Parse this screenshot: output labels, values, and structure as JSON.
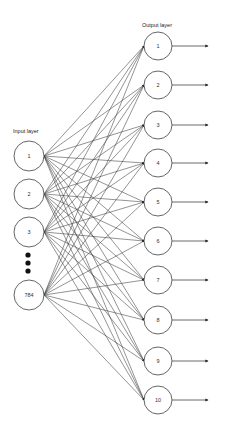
{
  "diagram": {
    "input_layer": {
      "label": "Input layer",
      "nodes": [
        {
          "label": "1",
          "cx": 29,
          "cy": 156
        },
        {
          "label": "2",
          "cx": 29,
          "cy": 194
        },
        {
          "label": "3",
          "cx": 29,
          "cy": 232
        },
        {
          "label": "784",
          "cx": 29,
          "cy": 295
        }
      ],
      "ellipsis_dots": [
        255,
        263,
        271
      ]
    },
    "output_layer": {
      "label": "Output layer",
      "nodes": [
        {
          "label": "1",
          "cx": 158,
          "cy": 46
        },
        {
          "label": "2",
          "cx": 158,
          "cy": 85
        },
        {
          "label": "3",
          "cx": 158,
          "cy": 125
        },
        {
          "label": "4",
          "cx": 158,
          "cy": 163
        },
        {
          "label": "5",
          "cx": 158,
          "cy": 202
        },
        {
          "label": "6",
          "cx": 158,
          "cy": 241
        },
        {
          "label": "7",
          "cx": 158,
          "cy": 280
        },
        {
          "label": "8",
          "cx": 158,
          "cy": 320
        },
        {
          "label": "9",
          "cx": 158,
          "cy": 361
        },
        {
          "label": "10",
          "cx": 158,
          "cy": 400
        }
      ]
    },
    "connections": "fully-connected",
    "colors": {
      "stroke": "#555555",
      "edge": "#3a3a3a",
      "background": "#ffffff"
    }
  }
}
